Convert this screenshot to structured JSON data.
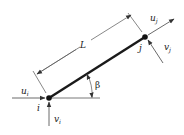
{
  "diagram": {
    "type": "truss-element-diagram",
    "colors": {
      "member": "#1a1a1a",
      "lines": "#444444",
      "text": "#222222",
      "background": "#ffffff"
    },
    "member": {
      "label": "L",
      "from_node": "i",
      "to_node": "j"
    },
    "angle": {
      "label": "β"
    },
    "nodes": [
      {
        "id": "i",
        "label": "i",
        "displacements": [
          {
            "base": "u",
            "sub": "i",
            "direction": "horizontal"
          },
          {
            "base": "v",
            "sub": "i",
            "direction": "vertical"
          }
        ]
      },
      {
        "id": "j",
        "label": "j",
        "displacements": [
          {
            "base": "u",
            "sub": "j",
            "direction": "axial"
          },
          {
            "base": "v",
            "sub": "j",
            "direction": "transverse"
          }
        ]
      }
    ]
  }
}
